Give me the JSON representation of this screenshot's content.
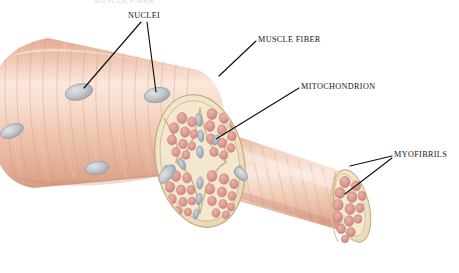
{
  "figure": {
    "kind": "anatomical-illustration",
    "background_color": "#ffffff",
    "width": 459,
    "height": 273,
    "cropped_caption_top": "MUSCLE FIBER"
  },
  "labels": [
    {
      "id": "nuclei",
      "text": "NUCLEI",
      "x": 128,
      "y": 12,
      "leaders": [
        {
          "from_x": 141,
          "from_y": 22,
          "to_x": 84,
          "to_y": 88
        },
        {
          "from_x": 147,
          "from_y": 22,
          "to_x": 156,
          "to_y": 92
        }
      ]
    },
    {
      "id": "muscle-fiber",
      "text": "MUSCLE FIBER",
      "x": 258,
      "y": 36,
      "leaders": [
        {
          "from_x": 256,
          "from_y": 41,
          "to_x": 219,
          "to_y": 76
        }
      ]
    },
    {
      "id": "mitochondrion",
      "text": "MITOCHONDRION",
      "x": 301,
      "y": 83,
      "leaders": [
        {
          "from_x": 299,
          "from_y": 88,
          "to_x": 216,
          "to_y": 139
        }
      ]
    },
    {
      "id": "myofibrils",
      "text": "MYOFIBRILS",
      "x": 394,
      "y": 151,
      "leaders": [
        {
          "from_x": 392,
          "from_y": 156,
          "to_x": 350,
          "to_y": 166
        },
        {
          "from_x": 392,
          "from_y": 158,
          "to_x": 345,
          "to_y": 194
        }
      ]
    }
  ],
  "structures": {
    "muscle_fiber": {
      "name": "muscle fiber",
      "description": "large pink striated cylinder running from lower-left to upper-right",
      "surface_color": "#e8b69e",
      "highlight_color": "#f7ded2",
      "striation_color": "#d79c86"
    },
    "nuclei": {
      "name": "nuclei",
      "description": "grey-blue flattened ovals on the fiber surface",
      "fill_color": "#b9bcc0",
      "count_visible": 5
    },
    "cross_section": {
      "name": "cut cross-section",
      "description": "disc face showing myofibril bundles in pale sarcoplasm",
      "matrix_color": "#f0e4c8",
      "bundle_color": "#dd9a95",
      "outline_color": "#c9b184"
    },
    "mitochondrion": {
      "name": "mitochondrion",
      "description": "small grey-blue elongated bodies between myofibril bundles",
      "fill_color": "#a9b2bd"
    },
    "myofibril_bundle": {
      "name": "myofibril bundle",
      "description": "smaller striated cylinder extending to the lower right with a cut end",
      "surface_color": "#e9b9a6",
      "cut_face_color": "#f1e5cb",
      "myofibril_color": "#dd9891"
    }
  }
}
